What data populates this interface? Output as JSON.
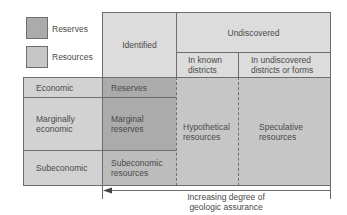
{
  "colors": {
    "reserves": "#ababab",
    "resources": "#c6c6c6",
    "header_light": "#dcdcdc",
    "row_light": "#d2d2d2",
    "line": "#6e6e6e",
    "text": "#4a4a4a"
  },
  "legend": [
    {
      "label": "Reserves",
      "swatch": "reserves"
    },
    {
      "label": "Resources",
      "swatch": "resources"
    }
  ],
  "headers": {
    "identified": "Identified",
    "undiscovered": "Undiscovered",
    "in_known_districts": "In known\ndistricts",
    "in_undiscovered_districts": "In undiscovered\ndistricts or forms"
  },
  "rows": [
    {
      "label": "Economic",
      "identified": "Reserves"
    },
    {
      "label": "Marginally\neconomic",
      "identified": "Marginal\nreserves"
    },
    {
      "label": "Subeconomic",
      "identified": "Subeconomic\nresources"
    }
  ],
  "undiscovered_cells": {
    "hypothetical": "Hypothetical\nresources",
    "speculative": "Speculative\nresources"
  },
  "axis": {
    "label": "Increasing degree of\ngeologic assurance",
    "direction": "left"
  }
}
